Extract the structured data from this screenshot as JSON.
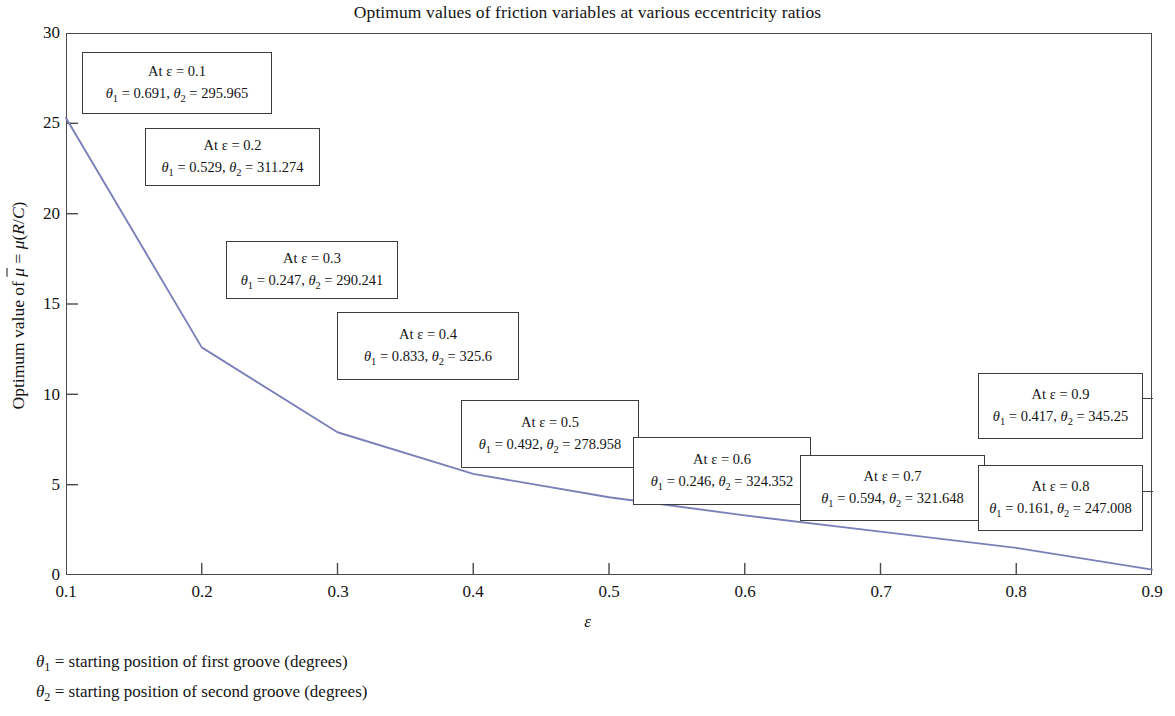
{
  "chart_data": {
    "type": "line",
    "title": "Optimum values of friction variables at various eccentricity ratios",
    "xlabel": "ε",
    "ylabel": "Optimum value of μ̄ = μ(R/C)",
    "xlim": [
      0.1,
      0.9
    ],
    "ylim": [
      0,
      30
    ],
    "grid": false,
    "legend": "none",
    "line_color": "#7b80b8",
    "x": [
      0.1,
      0.2,
      0.3,
      0.4,
      0.5,
      0.6,
      0.7,
      0.8,
      0.9
    ],
    "values": [
      25.3,
      12.6,
      7.9,
      5.6,
      4.3,
      3.3,
      2.4,
      1.5,
      0.3
    ],
    "xticks": [
      "0.1",
      "0.2",
      "0.3",
      "0.4",
      "0.5",
      "0.6",
      "0.7",
      "0.8",
      "0.9"
    ],
    "yticks": [
      "0",
      "5",
      "10",
      "15",
      "20",
      "25",
      "30"
    ],
    "annotations": [
      {
        "id": "anno-eps-0-1",
        "line1": "At ε = 0.1",
        "theta1": "0.691",
        "theta2": "295.965",
        "eps": "0.1"
      },
      {
        "id": "anno-eps-0-2",
        "line1": "At ε = 0.2",
        "theta1": "0.529",
        "theta2": "311.274",
        "eps": "0.2"
      },
      {
        "id": "anno-eps-0-3",
        "line1": "At ε = 0.3",
        "theta1": "0.247",
        "theta2": "290.241",
        "eps": "0.3"
      },
      {
        "id": "anno-eps-0-4",
        "line1": "At ε = 0.4",
        "theta1": "0.833",
        "theta2": "325.6",
        "eps": "0.4"
      },
      {
        "id": "anno-eps-0-5",
        "line1": "At ε = 0.5",
        "theta1": "0.492",
        "theta2": "278.958",
        "eps": "0.5"
      },
      {
        "id": "anno-eps-0-6",
        "line1": "At ε = 0.6",
        "theta1": "0.246",
        "theta2": "324.352",
        "eps": "0.6"
      },
      {
        "id": "anno-eps-0-7",
        "line1": "At ε = 0.7",
        "theta1": "0.594",
        "theta2": "321.648",
        "eps": "0.7"
      },
      {
        "id": "anno-eps-0-8",
        "line1": "At ε = 0.8",
        "theta1": "0.161",
        "theta2": "247.008",
        "eps": "0.8"
      },
      {
        "id": "anno-eps-0-9",
        "line1": "At ε = 0.9",
        "theta1": "0.417",
        "theta2": "345.25",
        "eps": "0.9"
      }
    ]
  },
  "footnotes": {
    "theta1_definition": "= starting position of first groove (degrees)",
    "theta2_definition": "= starting position of second groove (degrees)"
  }
}
